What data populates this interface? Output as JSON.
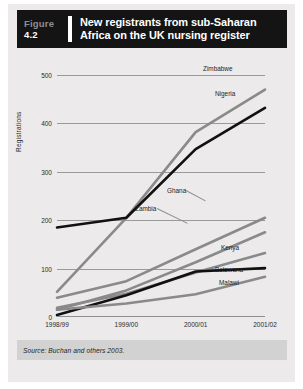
{
  "figure": {
    "label": "Figure",
    "number": "4.2",
    "title_line1": "New registrants from sub-Saharan",
    "title_line2": "Africa on the UK nursing register"
  },
  "source": "Source: Buchan and others 2003.",
  "colors": {
    "header_bg": "#141414",
    "page_bg": "#eceaea",
    "dark_line": "#111111",
    "gray_line": "#8a8a8a",
    "grid": "#9a9a9a",
    "source_band": "#d2d2d2"
  },
  "chart_data": {
    "type": "line",
    "title": "New registrants from sub-Saharan Africa on the UK nursing register",
    "xlabel": "",
    "ylabel": "Registrations",
    "categories": [
      "1998/99",
      "1999/00",
      "2000/01",
      "2001/02"
    ],
    "ylim": [
      0,
      500
    ],
    "yticks": [
      0,
      100,
      200,
      300,
      400,
      500
    ],
    "grid": true,
    "legend": "inline-right-labels",
    "series": [
      {
        "name": "Zimbabwe",
        "values": [
          52,
          205,
          382,
          470
        ],
        "color": "#8a8a8a"
      },
      {
        "name": "Nigeria",
        "values": [
          185,
          205,
          347,
          432
        ],
        "color": "#111111"
      },
      {
        "name": "Ghana",
        "values": [
          40,
          74,
          140,
          205
        ],
        "color": "#8a8a8a"
      },
      {
        "name": "Zambia",
        "values": [
          15,
          55,
          113,
          175
        ],
        "color": "#8a8a8a"
      },
      {
        "name": "Kenya",
        "values": [
          19,
          48,
          92,
          132
        ],
        "color": "#8a8a8a"
      },
      {
        "name": "Botswana",
        "values": [
          4,
          45,
          94,
          101
        ],
        "color": "#111111"
      },
      {
        "name": "Malawi",
        "values": [
          15,
          28,
          47,
          83
        ],
        "color": "#8a8a8a"
      }
    ]
  }
}
